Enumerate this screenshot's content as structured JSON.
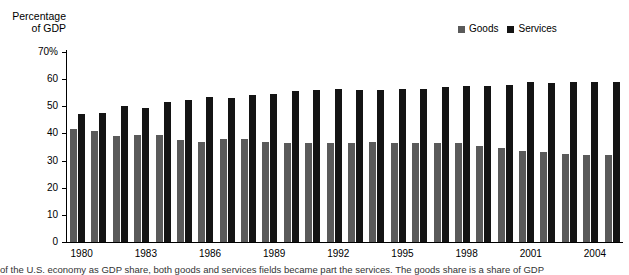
{
  "chart_data": {
    "type": "bar",
    "title": "",
    "ylabel": "Percentage of GDP",
    "xlabel": "",
    "ylim": [
      0,
      70
    ],
    "ytick_labels": [
      "70%",
      "60",
      "50",
      "40",
      "30",
      "20",
      "10",
      "0"
    ],
    "ytick_values": [
      70,
      60,
      50,
      40,
      30,
      20,
      10,
      0
    ],
    "grid": false,
    "legend_position": "top-right",
    "categories": [
      "1980",
      "1981",
      "1982",
      "1983",
      "1984",
      "1985",
      "1986",
      "1987",
      "1988",
      "1989",
      "1990",
      "1991",
      "1992",
      "1993",
      "1994",
      "1995",
      "1996",
      "1997",
      "1998",
      "1999",
      "2000",
      "2001",
      "2002",
      "2003",
      "2004",
      "2005"
    ],
    "xtick_labels": [
      "1980",
      "1983",
      "1986",
      "1989",
      "1992",
      "1995",
      "1998",
      "2001",
      "2004"
    ],
    "series": [
      {
        "name": "Goods",
        "color": "#5a5a5a",
        "values": [
          41.5,
          41.0,
          39.0,
          39.5,
          39.5,
          37.5,
          37.0,
          38.0,
          38.0,
          37.0,
          36.5,
          36.5,
          36.5,
          36.5,
          37.0,
          36.5,
          36.5,
          36.5,
          36.5,
          35.5,
          34.5,
          33.5,
          33.0,
          32.5,
          32.0,
          32.0
        ]
      },
      {
        "name": "Services",
        "color": "#141414",
        "values": [
          47.0,
          47.5,
          50.0,
          49.5,
          51.5,
          52.5,
          53.5,
          53.0,
          54.0,
          54.5,
          55.5,
          56.0,
          56.5,
          56.0,
          56.0,
          56.5,
          56.5,
          57.0,
          57.5,
          57.5,
          58.0,
          59.0,
          58.5,
          59.0,
          59.0,
          59.0
        ]
      }
    ]
  },
  "axis": {
    "ylabel_line1": "Percentage",
    "ylabel_line2": "of GDP"
  },
  "legend": {
    "items": [
      {
        "label": "Goods",
        "color": "#5a5a5a"
      },
      {
        "label": "Services",
        "color": "#141414"
      }
    ]
  },
  "caption": {
    "text": "of the U.S. economy as GDP share, both goods and services fields became part the services. The goods share is a share of GDP"
  }
}
